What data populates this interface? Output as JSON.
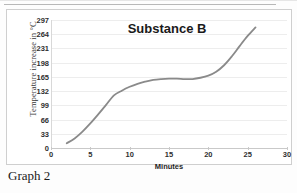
{
  "caption": "Graph 2",
  "chart_data": {
    "type": "line",
    "title": "Substance B",
    "xlabel": "Minutes",
    "ylabel": "Temperature increase in °C",
    "xlim": [
      0,
      30
    ],
    "ylim": [
      0,
      297
    ],
    "xticks": [
      0,
      5,
      10,
      15,
      20,
      25,
      30
    ],
    "yticks": [
      0,
      33,
      66,
      99,
      132,
      165,
      198,
      231,
      264,
      297
    ],
    "grid": true,
    "legend": "none",
    "line_color": "#8a8a8a",
    "x": [
      2,
      3,
      4,
      5,
      6,
      7,
      8,
      9,
      10,
      11,
      12,
      13,
      14,
      15,
      16,
      17,
      18,
      19,
      20,
      21,
      22,
      23,
      24,
      25,
      26
    ],
    "y": [
      11,
      22,
      38,
      57,
      78,
      100,
      122,
      133,
      142,
      149,
      154,
      158,
      160,
      161,
      161,
      160,
      160,
      163,
      168,
      177,
      192,
      213,
      237,
      260,
      280
    ],
    "series": [
      {
        "name": "Substance B",
        "values": [
          11,
          22,
          38,
          57,
          78,
          100,
          122,
          133,
          142,
          149,
          154,
          158,
          160,
          161,
          161,
          160,
          160,
          163,
          168,
          177,
          192,
          213,
          237,
          260,
          280
        ]
      }
    ]
  }
}
